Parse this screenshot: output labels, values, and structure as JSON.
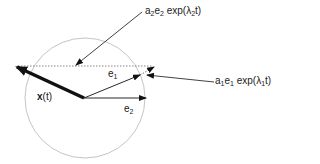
{
  "diagram": {
    "labels": {
      "a2_label": {
        "a": "a",
        "a_sub": "2",
        "e": "e",
        "e_sub": "2",
        "rest": " exp(λ",
        "lam_sub": "2",
        "tail": "t)"
      },
      "a1_label": {
        "a": "a",
        "a_sub": "1",
        "e": "e",
        "e_sub": "1",
        "rest": " exp(λ",
        "lam_sub": "1",
        "tail": "t)"
      },
      "e1": {
        "base": "e",
        "sub": "1"
      },
      "e2": {
        "base": "e",
        "sub": "2"
      },
      "xt": {
        "bold": "x",
        "rest": "(t)"
      }
    },
    "colors": {
      "circle": "#b5b5b5",
      "lines": "#111111"
    }
  }
}
